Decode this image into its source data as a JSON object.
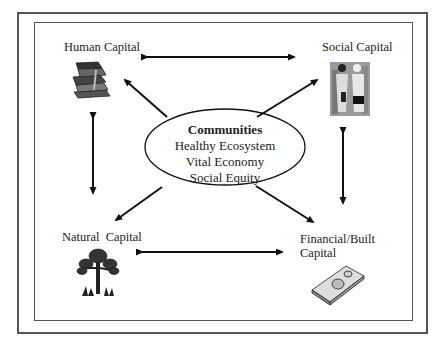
{
  "center": {
    "title": "Communities",
    "lines": [
      "Healthy Ecosystem",
      "Vital Economy",
      "Social Equity"
    ]
  },
  "nodes": {
    "human": {
      "label": "Human Capital",
      "icon": "books-icon"
    },
    "social": {
      "label": "Social Capital",
      "icon": "people-handshake-icon"
    },
    "natural": {
      "label": "Natural  Capital",
      "icon": "tree-icon"
    },
    "financial": {
      "label_line1": "Financial/Built",
      "label_line2": "Capital",
      "icon": "money-stack-icon"
    }
  },
  "colors": {
    "line": "#111111",
    "border": "#555555"
  }
}
